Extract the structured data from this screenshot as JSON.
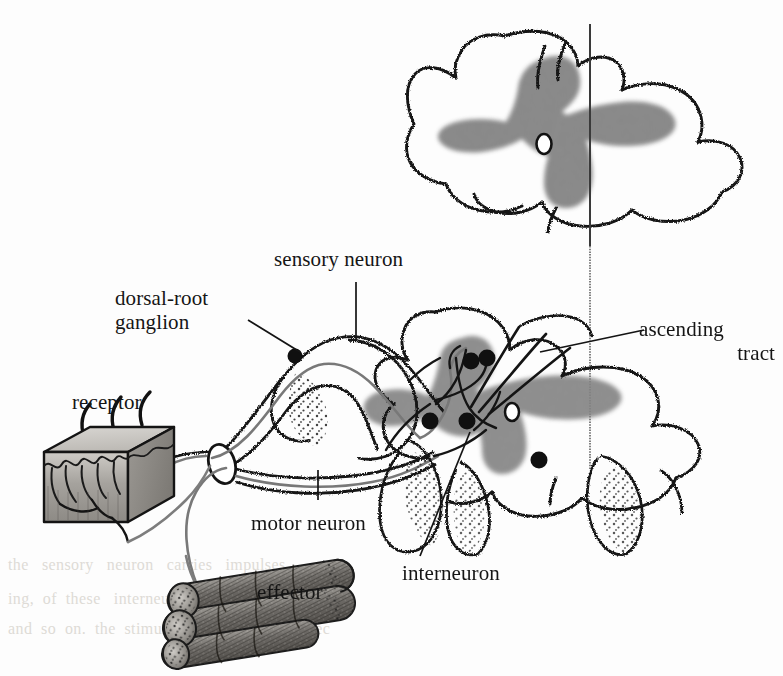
{
  "figure": {
    "title_alt": "spinal reflex arc diagram",
    "background_color": "#fdfdfd",
    "ink_color": "#141414",
    "gray_matter_color": "#8f8f8f",
    "nerve_color": "#6f6f6f"
  },
  "labels": {
    "sensory_neuron": "sensory neuron",
    "dorsal_root_ganglion_line1": "dorsal-root",
    "dorsal_root_ganglion_line2": "ganglion",
    "ascending_tract_line1": "ascending",
    "ascending_tract_line2": "tract",
    "receptor": "receptor",
    "motor_neuron": "motor neuron",
    "interneuron": "interneuron",
    "effector": "effector"
  },
  "structures": {
    "upper_cord_section": "spinal cord cross-section",
    "lower_cord_section": "spinal cord cross-section with reflex circuit",
    "central_canal": "central canal",
    "midline": "midline axis",
    "synapses_count": 5,
    "ascending_tract_fibers": 3,
    "receptor_hairs": 3,
    "effector_fibers": 5
  },
  "ghost_text": {
    "l1": "the   sensory   neuron   carries   impulses",
    "l2": "ing,  of  these   interneurons   synapse",
    "l3": "and  so  on.  the  stimulus  arrives  at  the  effec"
  }
}
